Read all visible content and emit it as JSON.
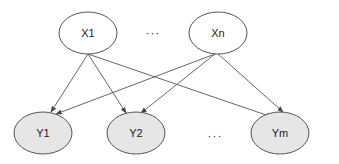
{
  "diagram": {
    "type": "bipartite directed graph",
    "colors": {
      "background": "#ffffff",
      "stroke": "#555555",
      "top_fill": "#ffffff",
      "bottom_fill": "#e6e6e6",
      "text": "#222222"
    },
    "top_nodes": [
      {
        "id": "x1",
        "label": "X1",
        "cx": 88,
        "cy": 33
      },
      {
        "id": "xn",
        "label": "Xn",
        "cx": 218,
        "cy": 33
      }
    ],
    "top_ellipsis": {
      "label": "···",
      "x": 153,
      "y": 37
    },
    "bottom_nodes": [
      {
        "id": "y1",
        "label": "Y1",
        "cx": 43,
        "cy": 133
      },
      {
        "id": "y2",
        "label": "Y2",
        "cx": 136,
        "cy": 133
      },
      {
        "id": "ym",
        "label": "Ym",
        "cx": 280,
        "cy": 133
      }
    ],
    "bottom_ellipsis": {
      "label": "···",
      "x": 215,
      "y": 140
    },
    "edges": [
      {
        "from": "X1",
        "to": "Y1"
      },
      {
        "from": "X1",
        "to": "Y2"
      },
      {
        "from": "X1",
        "to": "Ym"
      },
      {
        "from": "Xn",
        "to": "Y1"
      },
      {
        "from": "Xn",
        "to": "Y2"
      },
      {
        "from": "Xn",
        "to": "Ym"
      }
    ]
  }
}
